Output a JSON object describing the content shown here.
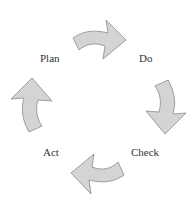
{
  "diagram": {
    "type": "cycle",
    "title": "",
    "stages": [
      {
        "id": "plan",
        "label": "Plan"
      },
      {
        "id": "do",
        "label": "Do"
      },
      {
        "id": "check",
        "label": "Check"
      },
      {
        "id": "act",
        "label": "Act"
      }
    ],
    "arrows": [
      {
        "from": "Plan",
        "to": "Do",
        "direction": "right"
      },
      {
        "from": "Do",
        "to": "Check",
        "direction": "down"
      },
      {
        "from": "Check",
        "to": "Act",
        "direction": "left"
      },
      {
        "from": "Act",
        "to": "Plan",
        "direction": "up"
      }
    ],
    "colors": {
      "arrow_fill": "#d4d4d4",
      "arrow_stroke": "#8a8a8a",
      "label_text": "#333333",
      "background": "#ffffff"
    }
  }
}
